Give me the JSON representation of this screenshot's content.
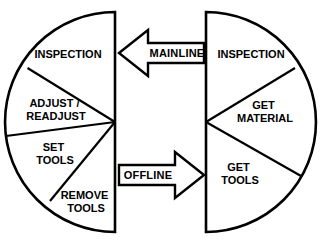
{
  "diagram": {
    "colors": {
      "stroke": "#000000",
      "fill": "#ffffff",
      "background": "#ffffff"
    },
    "left_wheel": {
      "name": "mainline-half-circle",
      "orientation": "left-half",
      "segments": [
        {
          "id": "left-inspection",
          "label": "INSPECTION",
          "lines": [
            "INSPECTION"
          ]
        },
        {
          "id": "left-adjust-readjust",
          "label": "ADJUST / READJUST",
          "lines": [
            "ADJUST /",
            "READJUST"
          ]
        },
        {
          "id": "left-set-tools",
          "label": "SET TOOLS",
          "lines": [
            "SET",
            "TOOLS"
          ]
        },
        {
          "id": "left-remove-tools",
          "label": "REMOVE TOOLS",
          "lines": [
            "REMOVE",
            "TOOLS"
          ]
        }
      ]
    },
    "right_wheel": {
      "name": "offline-half-circle",
      "orientation": "right-half",
      "segments": [
        {
          "id": "right-inspection",
          "label": "INSPECTION",
          "lines": [
            "INSPECTION"
          ]
        },
        {
          "id": "right-get-material",
          "label": "GET MATERIAL",
          "lines": [
            "GET",
            "MATERIAL"
          ]
        },
        {
          "id": "right-get-tools",
          "label": "GET TOOLS",
          "lines": [
            "GET",
            "TOOLS"
          ]
        }
      ]
    },
    "arrows": [
      {
        "id": "mainline-arrow",
        "label": "MAINLINE",
        "direction": "left"
      },
      {
        "id": "offline-arrow",
        "label": "OFFLINE",
        "direction": "right"
      }
    ]
  }
}
